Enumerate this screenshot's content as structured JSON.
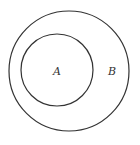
{
  "diagram": {
    "type": "venn-subset",
    "colors": {
      "stroke": "#333333",
      "background": "#ffffff"
    },
    "sets": [
      {
        "id": "outer",
        "label": "B",
        "cx": 69,
        "cy": 71,
        "r": 60,
        "label_x": 112,
        "label_y": 75
      },
      {
        "id": "inner",
        "label": "A",
        "cx": 57,
        "cy": 70,
        "r": 36,
        "label_x": 57,
        "label_y": 75
      }
    ]
  }
}
